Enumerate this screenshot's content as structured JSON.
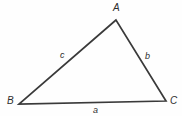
{
  "figure": {
    "type": "geometry-diagram",
    "shape": "triangle",
    "background_color": "#fefefe",
    "stroke_color": "#3a3a3a",
    "text_color": "#2e2e2e",
    "stroke_width": 1.7,
    "canvas": {
      "width": 182,
      "height": 116
    }
  },
  "vertices": [
    {
      "name": "A",
      "label": "A",
      "x": 116,
      "y": 20,
      "label_x": 113,
      "label_y": 3
    },
    {
      "name": "B",
      "label": "B",
      "x": 19,
      "y": 104,
      "label_x": 7,
      "label_y": 96
    },
    {
      "name": "C",
      "label": "C",
      "x": 166,
      "y": 101,
      "label_x": 170,
      "label_y": 96
    }
  ],
  "sides": [
    {
      "name": "a",
      "label": "a",
      "between": "B-C",
      "label_x": 93,
      "label_y": 106
    },
    {
      "name": "b",
      "label": "b",
      "between": "A-C",
      "label_x": 145,
      "label_y": 52
    },
    {
      "name": "c",
      "label": "c",
      "between": "A-B",
      "label_x": 60,
      "label_y": 51
    }
  ]
}
